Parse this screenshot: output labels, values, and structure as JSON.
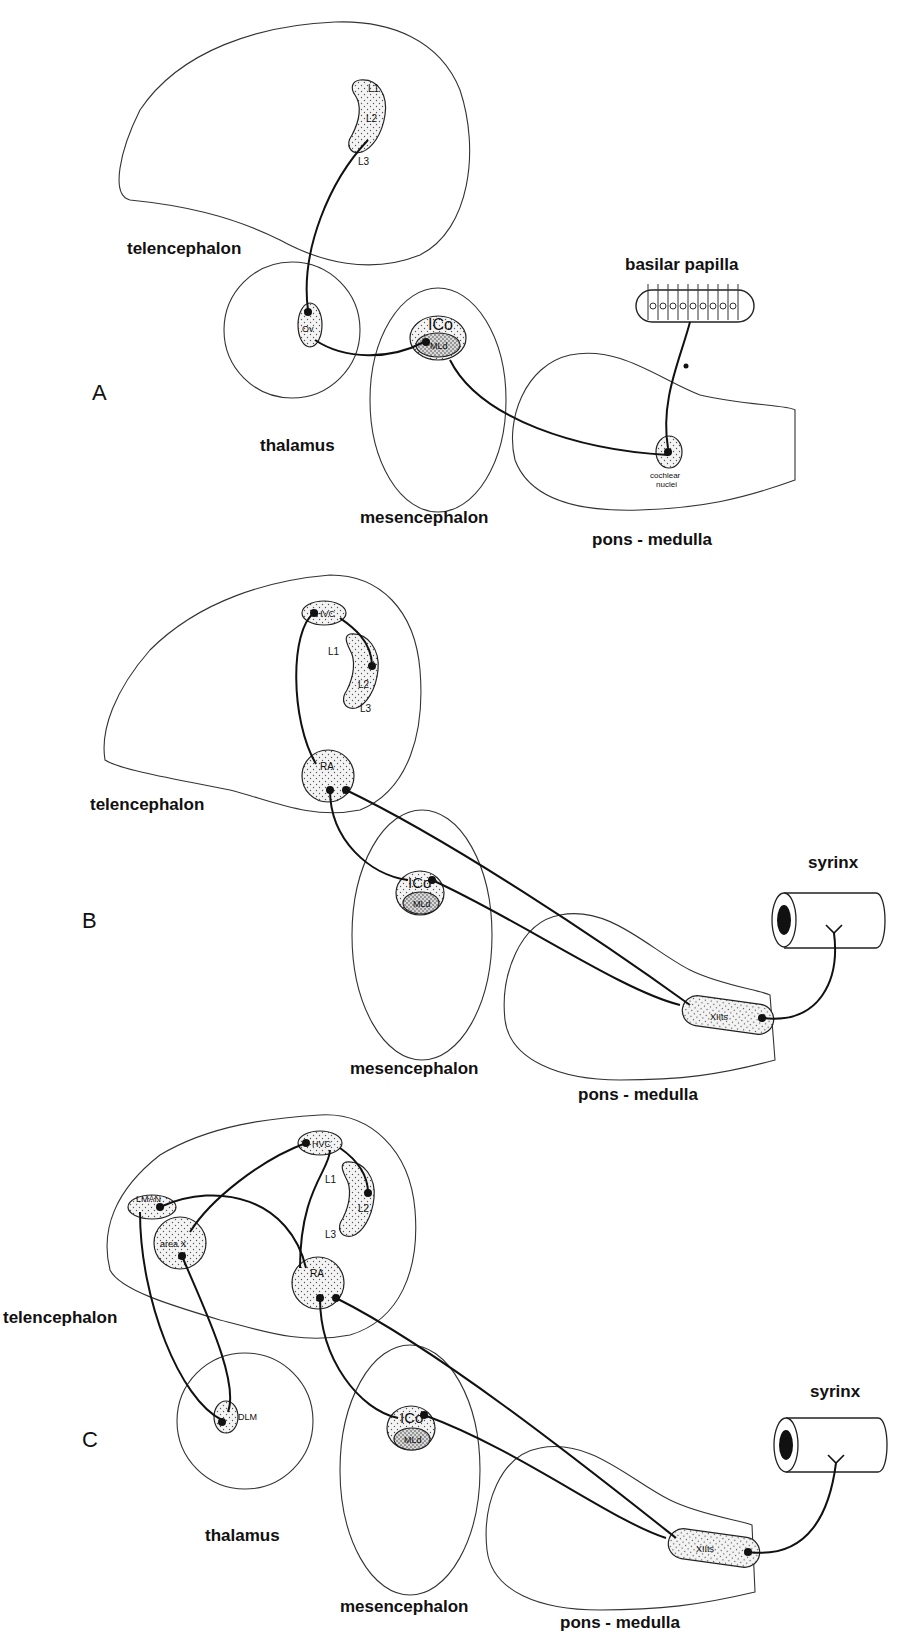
{
  "figure": {
    "panels": [
      {
        "id": "A",
        "label": "A",
        "regions": {
          "telencephalon": "telencephalon",
          "thalamus": "thalamus",
          "mesencephalon": "mesencephalon",
          "pons_medulla": "pons - medulla",
          "basilar_papilla": "basilar papilla"
        },
        "nuclei": {
          "L1": "L1",
          "L2": "L2",
          "L3": "L3",
          "Ov": "Ov",
          "ICo": "ICo",
          "MLd": "MLd",
          "cochlear_line1": "cochlear",
          "cochlear_line2": "nuclei"
        }
      },
      {
        "id": "B",
        "label": "B",
        "regions": {
          "telencephalon": "telencephalon",
          "mesencephalon": "mesencephalon",
          "pons_medulla": "pons - medulla",
          "syrinx": "syrinx"
        },
        "nuclei": {
          "HVC": "HVC",
          "L1": "L1",
          "L2": "L2",
          "L3": "L3",
          "RA": "RA",
          "ICo": "ICo",
          "MLd": "MLd",
          "XIIts": "XIIts"
        }
      },
      {
        "id": "C",
        "label": "C",
        "regions": {
          "telencephalon": "telencephalon",
          "thalamus": "thalamus",
          "mesencephalon": "mesencephalon",
          "pons_medulla": "pons - medulla",
          "syrinx": "syrinx"
        },
        "nuclei": {
          "HVC": "HVC",
          "L1": "L1",
          "L2": "L2",
          "L3": "L3",
          "LMAN": "LMAN",
          "areaX": "area X",
          "RA": "RA",
          "DLM": "DLM",
          "ICo": "ICo",
          "MLd": "MLd",
          "XIIts": "XIIts"
        }
      }
    ]
  }
}
